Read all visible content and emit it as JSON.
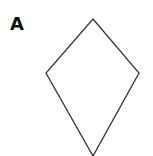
{
  "figure": {
    "label": "A",
    "shape": "kite",
    "stroke_color": "#333333",
    "vertices": {
      "top": [
        93,
        19
      ],
      "left": [
        46,
        73
      ],
      "right": [
        139,
        73
      ],
      "bottom": [
        93,
        156
      ]
    }
  }
}
